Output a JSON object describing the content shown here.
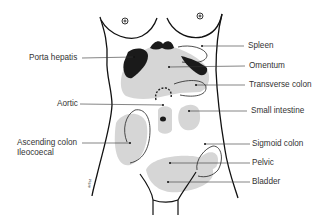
{
  "diagram": {
    "labels_left": [
      {
        "id": "porta-hepatis",
        "text": "Porta hepatis"
      },
      {
        "id": "aortic",
        "text": "Aortic"
      },
      {
        "id": "ascending-colon",
        "text": "Ascending colon"
      },
      {
        "id": "ileocoecal",
        "text": "Ileocoecal"
      }
    ],
    "labels_right": [
      {
        "id": "spleen",
        "text": "Spleen"
      },
      {
        "id": "omentum",
        "text": "Omentum"
      },
      {
        "id": "transverse-colon",
        "text": "Transverse colon"
      },
      {
        "id": "small-intestine",
        "text": "Small intestine"
      },
      {
        "id": "sigmoid-colon",
        "text": "Sigmoid colon"
      },
      {
        "id": "pelvic",
        "text": "Pelvic"
      },
      {
        "id": "bladder",
        "text": "Bladder"
      }
    ],
    "colors": {
      "outline": "#111111",
      "region_fill": "#d6d6d6",
      "leader_line": "#333333",
      "label_text": "#333333"
    }
  }
}
